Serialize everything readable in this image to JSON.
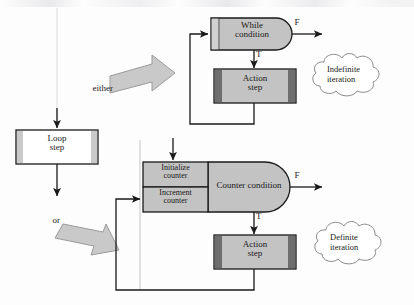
{
  "figure": {
    "title": "",
    "type": "flowchart-diagram",
    "colors": {
      "line": "#1a1a1a",
      "shape_fill": "#c3c3c3",
      "shape_dark_bar": "#6e6e6e",
      "shape_light_bar": "#c9c9c9",
      "box_white": "#ffffff",
      "block_arrow_fill": "#c9c9c9",
      "block_arrow_stroke": "#8c8c8c",
      "cloud_stroke": "#8a8a8a",
      "text": "#1a1a1a"
    }
  },
  "loop_step": {
    "line1": "Loop",
    "line2": "step"
  },
  "connectors": {
    "either": "either",
    "or": "or"
  },
  "indefinite_branch": {
    "condition": {
      "line1": "While",
      "line2": "condition"
    },
    "action": {
      "line1": "Action",
      "line2": "step"
    },
    "false_label": "F",
    "true_label": "T",
    "cloud": {
      "line1": "Indefinite",
      "line2": "iteration"
    }
  },
  "definite_branch": {
    "initialize": {
      "line1": "Initialize",
      "line2": "counter"
    },
    "increment": {
      "line1": "Increment",
      "line2": "counter"
    },
    "condition": "Counter condition",
    "action": {
      "line1": "Action",
      "line2": "step"
    },
    "false_label": "F",
    "true_label": "T",
    "cloud": {
      "line1": "Definite",
      "line2": "iteration"
    }
  }
}
